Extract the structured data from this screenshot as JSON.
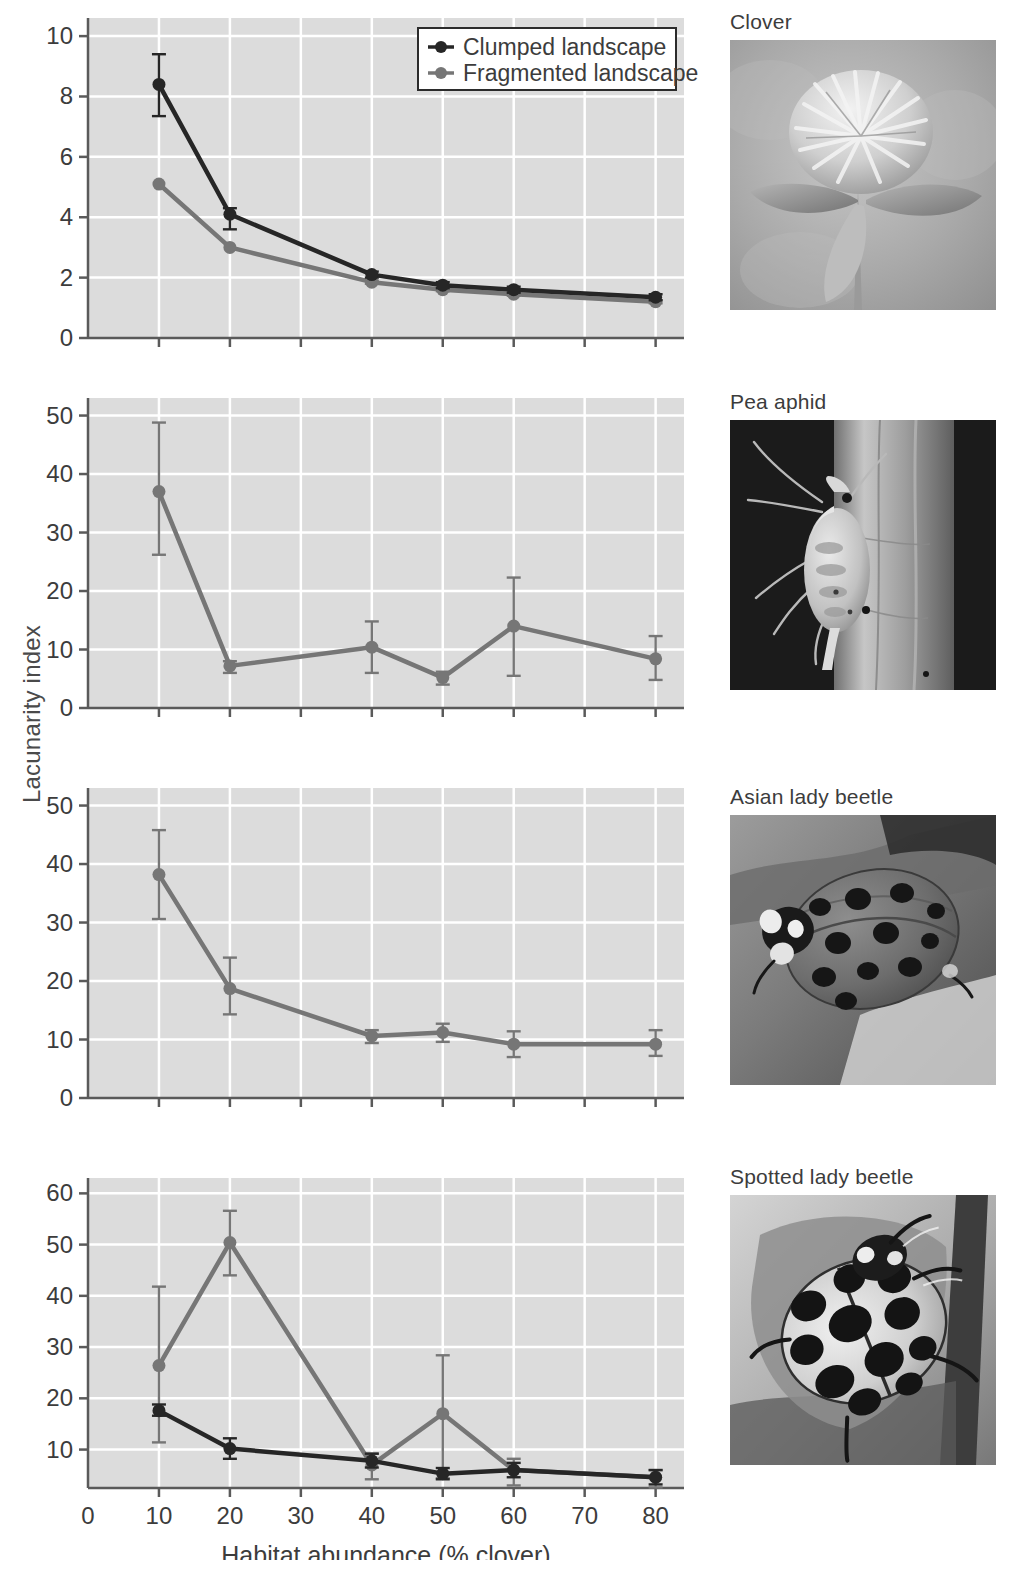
{
  "figure": {
    "y_axis_label": "Lacunarity index",
    "x_axis_label": "Habitat abundance (% clover)",
    "legend": {
      "items": [
        {
          "label": "Clumped landscape",
          "color": "#262626",
          "marker": "filled-circle"
        },
        {
          "label": "Fragmented landscape",
          "color": "#767676",
          "marker": "filled-circle"
        }
      ]
    },
    "colors": {
      "clumped": "#262626",
      "fragmented": "#767676",
      "plot_background": "#dcdcdc",
      "gridline": "#ffffff",
      "axis": "#5a5a5a",
      "text": "#3c3c3c"
    },
    "photos": [
      {
        "caption": "Clover",
        "subject": "red clover flower head with trifoliate leaves"
      },
      {
        "caption": "Pea aphid",
        "subject": "pea aphid on a plant stem"
      },
      {
        "caption": "Asian lady beetle",
        "subject": "Asian lady beetle on a leaf"
      },
      {
        "caption": "Spotted lady beetle",
        "subject": "spotted lady beetle on a leaf"
      }
    ]
  },
  "chart_data": [
    {
      "type": "line",
      "title": "Clover",
      "xlabel": "",
      "ylabel": "Lacunarity index",
      "x": [
        10,
        20,
        40,
        50,
        60,
        80
      ],
      "xlim": [
        0,
        84
      ],
      "ylim": [
        0,
        10.6
      ],
      "yticks": [
        0,
        2,
        4,
        6,
        8,
        10
      ],
      "xticks": [
        0,
        10,
        20,
        30,
        40,
        50,
        60,
        70,
        80
      ],
      "xticklabels_shown": false,
      "grid": true,
      "legend_position": "top-right",
      "series": [
        {
          "name": "Clumped landscape",
          "color": "#262626",
          "values": [
            8.4,
            4.1,
            2.1,
            1.75,
            1.6,
            1.35
          ],
          "err_low": [
            7.35,
            3.6,
            2.0,
            1.65,
            1.5,
            1.25
          ],
          "err_high": [
            9.4,
            4.3,
            2.2,
            1.85,
            1.7,
            1.45
          ]
        },
        {
          "name": "Fragmented landscape",
          "color": "#767676",
          "values": [
            5.1,
            3.0,
            1.85,
            1.6,
            1.45,
            1.2
          ],
          "err_low": [
            5.1,
            3.0,
            1.8,
            1.55,
            1.4,
            1.15
          ],
          "err_high": [
            5.1,
            3.0,
            1.9,
            1.65,
            1.5,
            1.25
          ]
        }
      ]
    },
    {
      "type": "line",
      "title": "Pea aphid",
      "xlabel": "",
      "ylabel": "Lacunarity index",
      "x": [
        10,
        20,
        40,
        50,
        60,
        80
      ],
      "xlim": [
        0,
        84
      ],
      "ylim": [
        0,
        53
      ],
      "yticks": [
        0,
        10,
        20,
        30,
        40,
        50
      ],
      "xticks": [
        0,
        10,
        20,
        30,
        40,
        50,
        60,
        70,
        80
      ],
      "xticklabels_shown": false,
      "grid": true,
      "legend_position": "none",
      "series": [
        {
          "name": "Fragmented landscape",
          "color": "#767676",
          "values": [
            37.0,
            7.2,
            10.4,
            5.2,
            14.0,
            8.4
          ],
          "err_low": [
            26.2,
            6.0,
            6.0,
            4.0,
            5.5,
            4.8
          ],
          "err_high": [
            48.8,
            8.0,
            14.8,
            6.2,
            22.3,
            12.3
          ]
        }
      ]
    },
    {
      "type": "line",
      "title": "Asian lady beetle",
      "xlabel": "",
      "ylabel": "Lacunarity index",
      "x": [
        10,
        20,
        40,
        50,
        60,
        80
      ],
      "xlim": [
        0,
        84
      ],
      "ylim": [
        0,
        53
      ],
      "yticks": [
        0,
        10,
        20,
        30,
        40,
        50
      ],
      "xticks": [
        0,
        10,
        20,
        30,
        40,
        50,
        60,
        70,
        80
      ],
      "xticklabels_shown": false,
      "grid": true,
      "legend_position": "none",
      "series": [
        {
          "name": "Fragmented landscape",
          "color": "#767676",
          "values": [
            38.2,
            18.7,
            10.6,
            11.2,
            9.2,
            9.2
          ],
          "err_low": [
            30.6,
            14.3,
            9.4,
            9.6,
            7.0,
            7.2
          ],
          "err_high": [
            45.8,
            24.0,
            11.6,
            12.7,
            11.4,
            11.6
          ]
        }
      ]
    },
    {
      "type": "line",
      "title": "Spotted lady beetle",
      "xlabel": "Habitat abundance (% clover)",
      "ylabel": "Lacunarity index",
      "x": [
        10,
        20,
        40,
        50,
        60,
        80
      ],
      "xlim": [
        0,
        84
      ],
      "ylim": [
        2.5,
        63
      ],
      "yticks": [
        10,
        20,
        30,
        40,
        50,
        60
      ],
      "xticks": [
        0,
        10,
        20,
        30,
        40,
        50,
        60,
        70,
        80
      ],
      "xticklabels_shown": true,
      "grid": true,
      "legend_position": "none",
      "series": [
        {
          "name": "Clumped landscape",
          "color": "#262626",
          "values": [
            17.6,
            10.2,
            7.8,
            5.3,
            6.0,
            4.6
          ],
          "err_low": [
            16.6,
            8.2,
            6.5,
            4.2,
            4.6,
            3.2
          ],
          "err_high": [
            18.8,
            12.2,
            9.2,
            6.4,
            7.4,
            6.0
          ]
        },
        {
          "name": "Fragmented landscape",
          "color": "#767676",
          "values": [
            26.4,
            50.4,
            7.0,
            17.0,
            6.0,
            4.6
          ],
          "err_low": [
            11.4,
            44.0,
            4.2,
            4.4,
            3.0,
            2.6
          ],
          "err_high": [
            41.8,
            56.6,
            9.2,
            28.4,
            8.2,
            6.0
          ]
        }
      ]
    }
  ]
}
